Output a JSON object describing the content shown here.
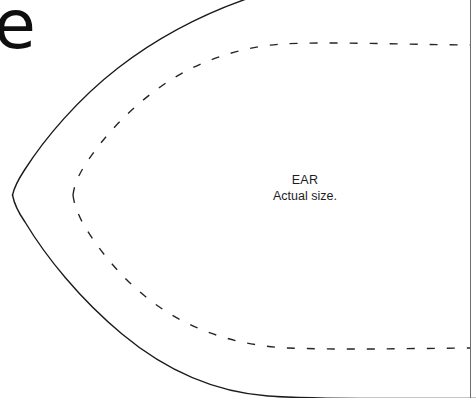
{
  "page": {
    "width": 476,
    "height": 398,
    "background_color": "#ffffff"
  },
  "corner_glyph": {
    "name": "letter-e-glyph",
    "text": "e",
    "color": "#100f10"
  },
  "label": {
    "title": "EAR",
    "subtitle": "Actual size.",
    "color": "#1d1d1f"
  },
  "shapes": {
    "cut_line": {
      "name": "ear-outer-cutting-line",
      "style": "solid",
      "color": "#1a1a1a",
      "width": 1.4,
      "description": "Outer pointed-oval ear outline, apex at left",
      "apex": [
        12,
        195
      ],
      "path": "M 12 195 L 24 173 C 60 112 120 58 186 24 C 216 8 240 0 252 -4 M 12 195 L 26 219 C 62 281 120 338 190 372 C 232 392 274 398 330 398 L 476 398"
    },
    "stitch_line": {
      "name": "ear-inner-stitching-line",
      "style": "dashed",
      "color": "#252525",
      "width": 1.4,
      "dash": [
        8,
        12
      ],
      "description": "Inner dashed seam-allowance line, parallel offset inside the cut line",
      "apex": [
        73,
        195
      ],
      "top_run_y": 45,
      "bottom_run_y": 348,
      "right_end_x": 470
    },
    "page_edge_rule": {
      "name": "page-edge-vertical-rule",
      "style": "solid",
      "color": "#6d6d6d",
      "width": 1,
      "x": 470
    }
  }
}
